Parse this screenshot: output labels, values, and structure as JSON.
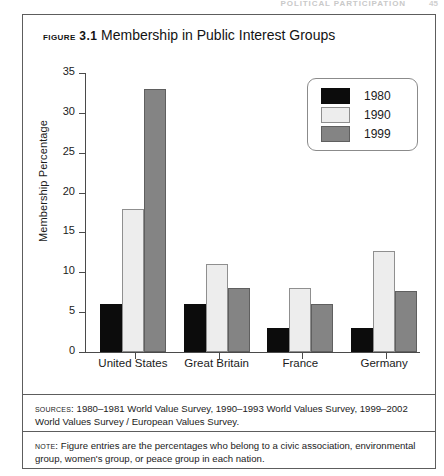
{
  "running_head": {
    "text": "POLITICAL PARTICIPATION",
    "page": "45"
  },
  "figure": {
    "label": "FIGURE 3.1",
    "title": "Membership in Public Interest Groups"
  },
  "sources": {
    "tag": "SOURCES:",
    "text": "1980–1981 World Value Survey, 1990–1993 World Values Survey, 1999–2002 World Values Survey / European Values Survey."
  },
  "note": {
    "tag": "NOTE:",
    "text": "Figure entries are the percentages who belong to a civic association, environmental group, women's group, or peace group in each nation."
  },
  "chart_data": {
    "type": "bar",
    "title": "Membership in Public Interest Groups",
    "xlabel": "",
    "ylabel": "Membership Percentage",
    "ylim": [
      0,
      35
    ],
    "yticks": [
      0,
      5,
      10,
      15,
      20,
      25,
      30,
      35
    ],
    "ytick_labels": [
      "0",
      "5",
      "10",
      "15",
      "20",
      "25",
      "30",
      "35"
    ],
    "grid": false,
    "legend_position": "upper right",
    "categories": [
      "United States",
      "Great Britain",
      "France",
      "Germany"
    ],
    "series": [
      {
        "name": "1980",
        "color": "#0c0c0c",
        "values": [
          6,
          6,
          3,
          3
        ]
      },
      {
        "name": "1990",
        "color": "#ededed",
        "values": [
          18,
          11,
          8,
          12.7
        ]
      },
      {
        "name": "1999",
        "color": "#848484",
        "values": [
          33,
          8,
          6,
          7.7
        ]
      }
    ]
  }
}
